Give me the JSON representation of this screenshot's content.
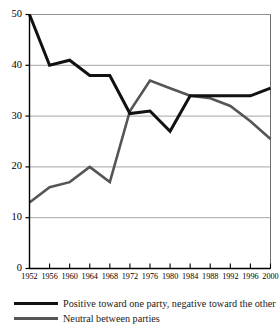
{
  "chart_data": {
    "type": "line",
    "title": "",
    "subtitle": "",
    "xlabel": "",
    "ylabel": "",
    "xlim": [
      1952,
      2000
    ],
    "ylim": [
      0,
      50
    ],
    "grid": true,
    "legend_position": "bottom-left",
    "x": [
      1952,
      1956,
      1960,
      1964,
      1968,
      1972,
      1976,
      1980,
      1984,
      1988,
      1992,
      1996,
      2000
    ],
    "xtick_labels": [
      "1952",
      "1956",
      "1960",
      "1964",
      "1968",
      "1972",
      "1976",
      "1980",
      "1984",
      "1988",
      "1992",
      "1996",
      "2000"
    ],
    "ytick_labels": [
      "0",
      "10",
      "20",
      "30",
      "40",
      "50"
    ],
    "yticks": [
      0,
      10,
      20,
      30,
      40,
      50
    ],
    "series": [
      {
        "name": "Positive toward one party, negative toward the other",
        "color": "#111111",
        "width": 3,
        "values": [
          50,
          40,
          41,
          38,
          38,
          30.5,
          31,
          27,
          34,
          34,
          34,
          34,
          35.5
        ]
      },
      {
        "name": "Neutral between parties",
        "color": "#555555",
        "width": 2.6,
        "values": [
          13,
          16,
          17,
          20,
          17,
          31,
          37,
          35.5,
          34,
          33.5,
          32,
          29,
          25.5
        ]
      }
    ]
  },
  "legend": {
    "items": [
      {
        "label": "Positive toward one party, negative toward the other",
        "color": "#111111"
      },
      {
        "label": "Neutral between parties",
        "color": "#555555"
      }
    ]
  },
  "colors": {
    "axis": "#000000",
    "grid": "#9a9a9a",
    "frame": "#6e6e6e",
    "series_primary": "#111111",
    "series_secondary": "#555555",
    "background": "#ffffff"
  }
}
